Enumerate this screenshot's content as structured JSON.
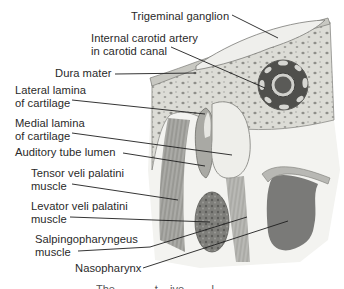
{
  "figure": {
    "type": "anatomical-cross-section",
    "colors": {
      "bone": "#dcdcd6",
      "bone_pores": "#8f8f8a",
      "ganglion": "#efefec",
      "dura": "#c8c8c2",
      "cartilage": "#d9d9d4",
      "lumen": "#eeeeea",
      "muscle": "#9a9a96",
      "muscle_dark": "#6e6e6a",
      "nasopharynx": "#7a7a78",
      "leader_line": "#1e1e1e",
      "text": "#2a2a2a"
    }
  },
  "labels": [
    {
      "id": "trigeminal-ganglion",
      "lines": [
        "Trigeminal ganglion"
      ]
    },
    {
      "id": "internal-carotid-artery",
      "lines": [
        "Internal carotid artery",
        "in carotid canal"
      ]
    },
    {
      "id": "dura-mater",
      "lines": [
        "Dura mater"
      ]
    },
    {
      "id": "lateral-lamina",
      "lines": [
        "Lateral lamina",
        "of cartilage"
      ]
    },
    {
      "id": "medial-lamina",
      "lines": [
        "Medial lamina",
        "of cartilage"
      ]
    },
    {
      "id": "auditory-tube-lumen",
      "lines": [
        "Auditory tube lumen"
      ]
    },
    {
      "id": "tensor-veli-palatini",
      "lines": [
        "Tensor veli palatini",
        "muscle"
      ]
    },
    {
      "id": "levator-veli-palatini",
      "lines": [
        "Levator veli palatini",
        "muscle"
      ]
    },
    {
      "id": "salpingopharyngeus",
      "lines": [
        "Salpingopharyngeus",
        "muscle"
      ]
    },
    {
      "id": "nasopharynx",
      "lines": [
        "Nasopharynx"
      ]
    }
  ],
  "caption": {
    "text": "The ... ... ... t... ive ... ... l..."
  }
}
